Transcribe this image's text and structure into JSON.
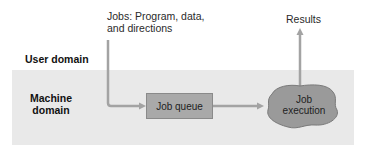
{
  "diagram": {
    "input_label_line1": "Jobs: Program, data,",
    "input_label_line2": "and directions",
    "output_label": "Results",
    "user_domain_label": "User domain",
    "machine_domain_line1": "Machine",
    "machine_domain_line2": "domain",
    "job_queue_label": "Job queue",
    "job_execution_line1": "Job",
    "job_execution_line2": "execution"
  },
  "colors": {
    "machine_band": "#e9e9e9",
    "arrow": "#a3a3a3",
    "queue_fill": "#a9a9a9",
    "execution_fill": "#9a9a9a"
  }
}
